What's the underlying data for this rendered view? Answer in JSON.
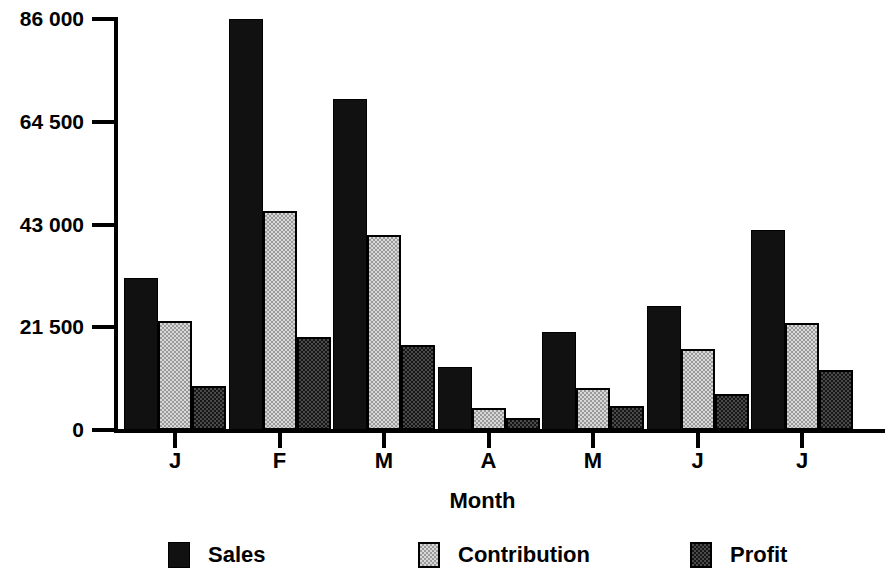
{
  "chart_data": {
    "type": "bar",
    "title": "",
    "xlabel": "Month",
    "ylabel": "",
    "categories": [
      "J",
      "F",
      "M",
      "A",
      "M",
      "J",
      "J"
    ],
    "category_full_names": [
      "January",
      "February",
      "March",
      "April",
      "May",
      "June",
      "July"
    ],
    "series": [
      {
        "name": "Sales",
        "values": [
          31800,
          86000,
          69200,
          13200,
          20500,
          25900,
          41800
        ],
        "fill": "solid-black",
        "color": "#111111"
      },
      {
        "name": "Contribution",
        "values": [
          22800,
          45800,
          40800,
          4600,
          8800,
          17000,
          22400
        ],
        "fill": "light-checker",
        "color": "#d8d8d8"
      },
      {
        "name": "Profit",
        "values": [
          9200,
          19500,
          17800,
          2500,
          5000,
          7500,
          12600
        ],
        "fill": "dark-checker",
        "color": "#4a4a4a"
      }
    ],
    "ylim": [
      0,
      86000
    ],
    "ytick_values": [
      86000,
      64500,
      43000,
      21500,
      0
    ],
    "ytick_labels": [
      "86 000",
      "64 500",
      "43 000",
      "21 500",
      "0"
    ],
    "grid": false,
    "legend_position": "bottom",
    "legend_entries": [
      "Sales",
      "Contribution",
      "Profit"
    ],
    "background_color": "#ffffff",
    "axis_color": "#000000"
  },
  "axes": {
    "y_title": "",
    "x_title": "Month"
  }
}
